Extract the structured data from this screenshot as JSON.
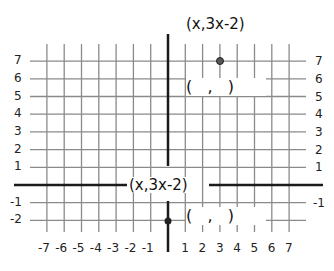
{
  "diagram": {
    "type": "coordinate-grid",
    "x_range": [
      -7,
      7
    ],
    "y_range": [
      -2,
      7
    ],
    "x_tick_labels": [
      "-7",
      "-6",
      "-5",
      "-4",
      "-3",
      "-2",
      "-1",
      "1",
      "2",
      "3",
      "4",
      "5",
      "6",
      "7"
    ],
    "y_tick_labels_left": [
      "7",
      "6",
      "5",
      "4",
      "3",
      "2",
      "1",
      "-1",
      "-2"
    ],
    "y_tick_labels_right": [
      "7",
      "6",
      "5",
      "4",
      "3",
      "2",
      "1",
      "-1"
    ],
    "colors": {
      "grid": "#8a8a8a",
      "axis": "#1a1a1a",
      "point": "#555555"
    }
  },
  "labels": {
    "top_point_label": "(x,3x-2)",
    "axis_point_label": "(x,3x-2)",
    "top_answer_blank": "(   ,   )",
    "bottom_answer_blank": "(   ,   )"
  },
  "points": [
    {
      "name": "top-point",
      "x": 3,
      "y": 7
    },
    {
      "name": "bottom-point",
      "x": 0,
      "y": -2
    }
  ]
}
